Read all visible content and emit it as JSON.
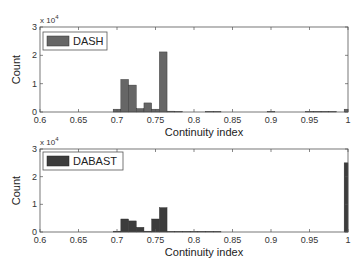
{
  "chart_data": [
    {
      "type": "bar",
      "title": "",
      "xlabel": "Continuity index",
      "ylabel": "Count",
      "y_multiplier": "x 10^4",
      "xlim": [
        0.6,
        1.0
      ],
      "ylim": [
        0,
        3
      ],
      "xticks": [
        "0.6",
        "0.65",
        "0.7",
        "0.75",
        "0.8",
        "0.85",
        "0.9",
        "0.95",
        "1"
      ],
      "yticks": [
        "0",
        "1",
        "2",
        "3"
      ],
      "legend": {
        "label": "DASH",
        "position": "upper left"
      },
      "color": "#666666",
      "bin_width": 0.01,
      "bins": [
        {
          "x": 0.7,
          "value": 0.1
        },
        {
          "x": 0.71,
          "value": 1.15
        },
        {
          "x": 0.72,
          "value": 0.95
        },
        {
          "x": 0.73,
          "value": 0.12
        },
        {
          "x": 0.74,
          "value": 0.32
        },
        {
          "x": 0.75,
          "value": 0.1
        },
        {
          "x": 0.76,
          "value": 2.12
        },
        {
          "x": 0.77,
          "value": 0.03
        },
        {
          "x": 0.78,
          "value": 0.02
        },
        {
          "x": 0.82,
          "value": 0.02
        },
        {
          "x": 0.83,
          "value": 0.02
        },
        {
          "x": 0.9,
          "value": 0.02
        },
        {
          "x": 0.95,
          "value": 0.02
        },
        {
          "x": 0.96,
          "value": 0.02
        },
        {
          "x": 0.97,
          "value": 0.02
        },
        {
          "x": 0.98,
          "value": 0.02
        },
        {
          "x": 1.0,
          "value": 0.1
        }
      ]
    },
    {
      "type": "bar",
      "title": "",
      "xlabel": "Continuity index",
      "ylabel": "Count",
      "y_multiplier": "x 10^4",
      "xlim": [
        0.6,
        1.0
      ],
      "ylim": [
        0,
        3
      ],
      "xticks": [
        "0.6",
        "0.65",
        "0.7",
        "0.75",
        "0.8",
        "0.85",
        "0.9",
        "0.95",
        "1"
      ],
      "yticks": [
        "0",
        "1",
        "2",
        "3"
      ],
      "legend": {
        "label": "DABAST",
        "position": "upper left"
      },
      "color": "#3c3c3c",
      "bin_width": 0.01,
      "bins": [
        {
          "x": 0.7,
          "value": 0.03
        },
        {
          "x": 0.71,
          "value": 0.47
        },
        {
          "x": 0.72,
          "value": 0.4
        },
        {
          "x": 0.73,
          "value": 0.17
        },
        {
          "x": 0.74,
          "value": 0.03
        },
        {
          "x": 0.75,
          "value": 0.47
        },
        {
          "x": 0.76,
          "value": 0.88
        },
        {
          "x": 0.77,
          "value": 0.02
        },
        {
          "x": 0.78,
          "value": 0.02
        },
        {
          "x": 0.79,
          "value": 0.02
        },
        {
          "x": 0.8,
          "value": 0.02
        },
        {
          "x": 0.81,
          "value": 0.02
        },
        {
          "x": 0.82,
          "value": 0.02
        },
        {
          "x": 0.83,
          "value": 0.02
        },
        {
          "x": 1.0,
          "value": 2.5
        }
      ]
    }
  ],
  "panels": [
    {
      "legend_label": "DASH",
      "ylabel": "Count",
      "xlabel": "Continuity index",
      "exp_base": "x 10",
      "exp_power": "4"
    },
    {
      "legend_label": "DABAST",
      "ylabel": "Count",
      "xlabel": "Continuity index",
      "exp_base": "x 10",
      "exp_power": "4"
    }
  ]
}
